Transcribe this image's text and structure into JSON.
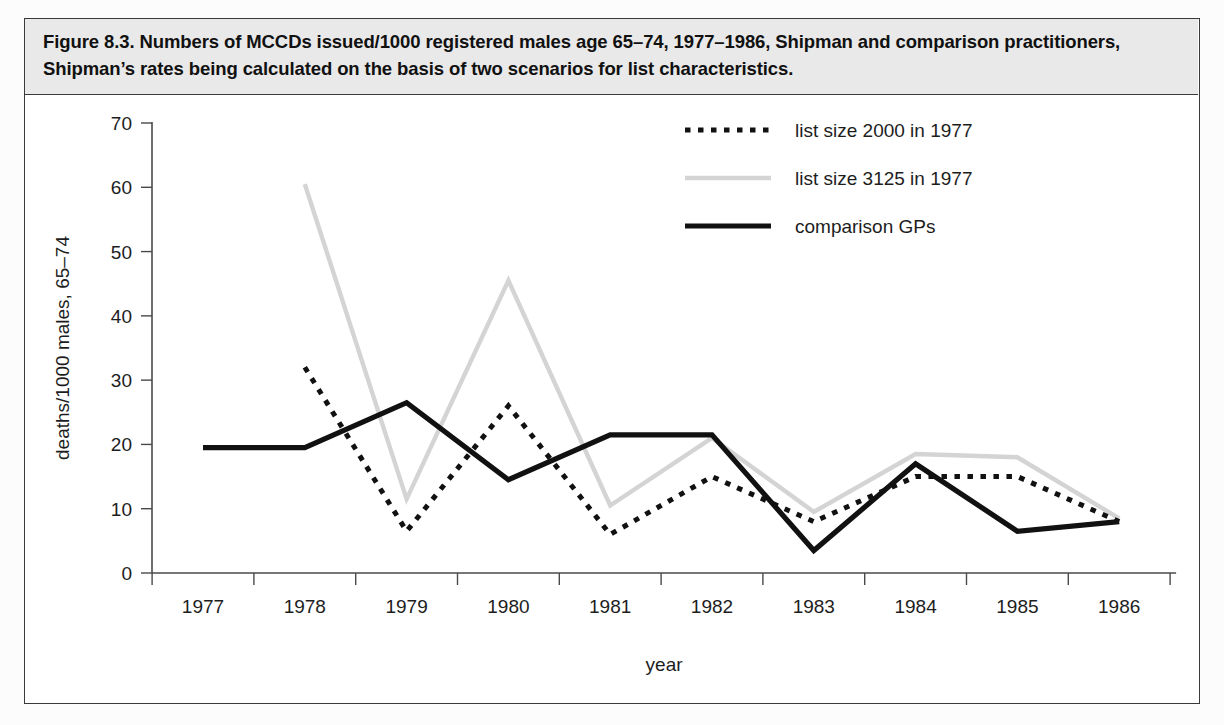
{
  "figure": {
    "caption": "Figure 8.3. Numbers of MCCDs issued/1000 registered males age 65–74, 1977–1986, Shipman and comparison practitioners, Shipman’s rates being calculated on the basis of two scenarios for list characteristics."
  },
  "chart_data": {
    "type": "line",
    "title": "Figure 8.3. Numbers of MCCDs issued/1000 registered males age 65–74, 1977–1986, Shipman and comparison practitioners, Shipman’s rates being calculated on the basis of two scenarios for list characteristics.",
    "xlabel": "year",
    "ylabel": "deaths/1000 males, 65–74",
    "categories": [
      "1977",
      "1978",
      "1979",
      "1980",
      "1981",
      "1982",
      "1983",
      "1984",
      "1985",
      "1986"
    ],
    "xtick_labels": [
      "1977",
      "1978",
      "1979",
      "1980",
      "1981",
      "1982",
      "1983",
      "1984",
      "1985",
      "1986"
    ],
    "ytick_labels": [
      "0",
      "10",
      "20",
      "30",
      "40",
      "50",
      "60",
      "70"
    ],
    "yticks": [
      0,
      10,
      20,
      30,
      40,
      50,
      60,
      70
    ],
    "ylim": [
      0,
      70
    ],
    "grid": false,
    "legend_position": "top-right",
    "series": [
      {
        "name": "list size 2000 in 1977",
        "style": "dotted",
        "color": "#111111",
        "values": [
          null,
          32.0,
          6.5,
          26.0,
          6.0,
          15.0,
          8.0,
          15.0,
          15.0,
          8.0
        ]
      },
      {
        "name": "list size 3125 in 1977",
        "style": "light-solid",
        "color": "#d4d4d4",
        "values": [
          null,
          60.5,
          11.5,
          45.5,
          10.5,
          21.0,
          9.5,
          18.5,
          18.0,
          8.5
        ]
      },
      {
        "name": "comparison GPs",
        "style": "solid",
        "color": "#111111",
        "values": [
          19.5,
          19.5,
          26.5,
          14.5,
          21.5,
          21.5,
          3.5,
          17.0,
          6.5,
          8.0
        ]
      }
    ]
  },
  "legend": {
    "items": [
      {
        "label": "list size 2000 in 1977"
      },
      {
        "label": "list size 3125 in 1977"
      },
      {
        "label": "comparison GPs"
      }
    ]
  }
}
